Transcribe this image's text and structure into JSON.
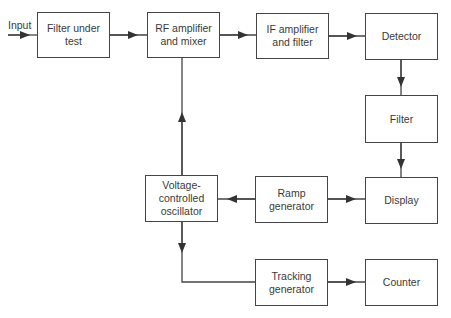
{
  "diagram": {
    "input_label": "Input",
    "blocks": {
      "filter_under_test": "Filter under\ntest",
      "rf_amp": "RF amplifier\nand mixer",
      "if_amp": "IF amplifier\nand filter",
      "detector": "Detector",
      "filter": "Filter",
      "display": "Display",
      "vco": "Voltage-\ncontrolled\noscillator",
      "ramp": "Ramp\ngenerator",
      "tracking": "Tracking\ngenerator",
      "counter": "Counter"
    },
    "connections": [
      {
        "from": "input",
        "to": "filter_under_test"
      },
      {
        "from": "filter_under_test",
        "to": "rf_amp"
      },
      {
        "from": "rf_amp",
        "to": "if_amp"
      },
      {
        "from": "if_amp",
        "to": "detector"
      },
      {
        "from": "detector",
        "to": "filter"
      },
      {
        "from": "filter",
        "to": "display"
      },
      {
        "from": "ramp",
        "to": "vco"
      },
      {
        "from": "ramp",
        "to": "display"
      },
      {
        "from": "vco",
        "to": "rf_amp"
      },
      {
        "from": "vco",
        "to": "tracking"
      },
      {
        "from": "tracking",
        "to": "counter"
      }
    ],
    "line_color": "#444444"
  }
}
